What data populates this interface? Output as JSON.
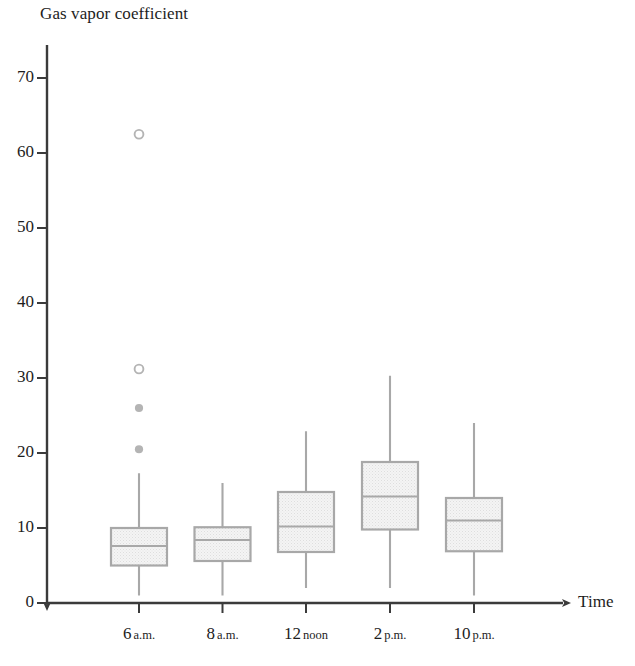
{
  "chart_data": {
    "type": "box",
    "title": "",
    "ylabel": "Gas vapor coefficient",
    "xlabel": "Time",
    "ylim": [
      0,
      75
    ],
    "yticks": [
      0,
      10,
      20,
      30,
      40,
      50,
      60,
      70
    ],
    "grid": false,
    "legend": "none",
    "categories": [
      "6 a.m.",
      "8 a.m.",
      "12 noon",
      "2 p.m.",
      "10 p.m."
    ],
    "category_parts": [
      {
        "num": "6",
        "per": "a.m."
      },
      {
        "num": "8",
        "per": "a.m."
      },
      {
        "num": "12",
        "per": "noon"
      },
      {
        "num": "2",
        "per": "p.m."
      },
      {
        "num": "10",
        "per": "p.m."
      }
    ],
    "boxes": [
      {
        "category": "6 a.m.",
        "whisker_low": 1.0,
        "q1": 5.0,
        "median": 7.6,
        "q3": 10.0,
        "whisker_high": 17.3,
        "mild_outliers": [
          20.5,
          26.0
        ],
        "extreme_outliers": [
          31.2,
          62.5
        ]
      },
      {
        "category": "8 a.m.",
        "whisker_low": 1.0,
        "q1": 5.6,
        "median": 8.4,
        "q3": 10.1,
        "whisker_high": 16.0,
        "mild_outliers": [],
        "extreme_outliers": []
      },
      {
        "category": "12 noon",
        "whisker_low": 2.0,
        "q1": 6.8,
        "median": 10.2,
        "q3": 14.8,
        "whisker_high": 22.9,
        "mild_outliers": [],
        "extreme_outliers": []
      },
      {
        "category": "2 p.m.",
        "whisker_low": 2.0,
        "q1": 9.8,
        "median": 14.2,
        "q3": 18.8,
        "whisker_high": 30.3,
        "mild_outliers": [],
        "extreme_outliers": []
      },
      {
        "category": "10 p.m.",
        "whisker_low": 1.0,
        "q1": 6.9,
        "median": 11.0,
        "q3": 14.0,
        "whisker_high": 24.0,
        "mild_outliers": [],
        "extreme_outliers": []
      }
    ],
    "colors": {
      "axis": "#3b3b3b",
      "box_border": "#a8a8a8",
      "box_fill": "#f1f1f1",
      "whisker": "#a8a8a8",
      "outlier_filled": "#b4b4b4",
      "outlier_open": "#b4b4b4",
      "text": "#1d1d1d"
    }
  }
}
